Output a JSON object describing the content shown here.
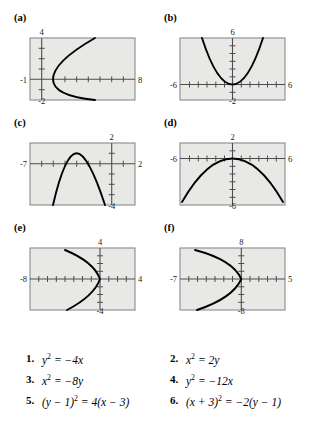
{
  "figure": {
    "type": "multi-panel-graph-matching-exercise",
    "panel_count": 6,
    "plot_bg_color": "#e8e8e6",
    "plot_border_color": "#8a8a8a",
    "curve_color": "#000000",
    "axis_color": "#555555"
  },
  "panels": [
    {
      "label": "(a)",
      "xmin": -1,
      "xmax": 8,
      "ymin": -2,
      "ymax": 4,
      "left_label": "-1",
      "right_label": "8",
      "top_label": "4",
      "bottom_label": "-2",
      "curve": {
        "form": "y^2 = 4(x - 1)",
        "opens": "right",
        "vertex_x": 1,
        "vertex_y": 0,
        "coef": 4
      }
    },
    {
      "label": "(b)",
      "xmin": -6,
      "xmax": 6,
      "ymin": -2,
      "ymax": 6,
      "left_label": "-6",
      "right_label": "6",
      "top_label": "6",
      "bottom_label": "-2",
      "curve": {
        "form": "x^2 = 2y",
        "opens": "up",
        "vertex_x": 0,
        "vertex_y": 0,
        "coef": 0.5
      }
    },
    {
      "label": "(c)",
      "xmin": -7,
      "xmax": 2,
      "ymin": -4,
      "ymax": 2,
      "left_label": "-7",
      "right_label": "2",
      "top_label": "2",
      "bottom_label": "-4",
      "curve": {
        "form": "(x + 3)^2 = -2(y - 1)",
        "opens": "down",
        "vertex_x": -3,
        "vertex_y": 1,
        "coef": -0.5
      }
    },
    {
      "label": "(d)",
      "xmin": -6,
      "xmax": 6,
      "ymin": -6,
      "ymax": 2,
      "left_label": "-6",
      "right_label": "6",
      "top_label": "2",
      "bottom_label": "-6",
      "curve": {
        "form": "x^2 = -8y",
        "opens": "down",
        "vertex_x": 0,
        "vertex_y": 0,
        "coef": -0.125
      }
    },
    {
      "label": "(e)",
      "xmin": -8,
      "xmax": 4,
      "ymin": -4,
      "ymax": 4,
      "left_label": "-8",
      "right_label": "4",
      "top_label": "4",
      "bottom_label": "-4",
      "curve": {
        "form": "y^2 = -4x",
        "opens": "left",
        "vertex_x": 0,
        "vertex_y": 0,
        "coef": -4
      }
    },
    {
      "label": "(f)",
      "xmin": -7,
      "xmax": 5,
      "ymin": -8,
      "ymax": 8,
      "left_label": "-7",
      "right_label": "5",
      "top_label": "8",
      "bottom_label": "-8",
      "curve": {
        "form": "y^2 = -12x",
        "opens": "left",
        "vertex_x": 0,
        "vertex_y": 0,
        "coef": -12
      }
    }
  ],
  "equations": [
    {
      "number": "1.",
      "lhs_base": "y",
      "lhs_exp": "2",
      "rhs": " = −4x",
      "plain": "y2 = -4x"
    },
    {
      "number": "2.",
      "lhs_base": "x",
      "lhs_exp": "2",
      "rhs": " = 2y",
      "plain": "x2 = 2y"
    },
    {
      "number": "3.",
      "lhs_base": "x",
      "lhs_exp": "2",
      "rhs": " = −8y",
      "plain": "x2 = -8y"
    },
    {
      "number": "4.",
      "lhs_base": "y",
      "lhs_exp": "2",
      "rhs": " = −12x",
      "plain": "y2 = -12x"
    },
    {
      "number": "5.",
      "lhs_base": "(y − 1)",
      "lhs_exp": "2",
      "rhs": " = 4(x − 3)",
      "plain": "(y - 1)2 = 4(x - 3)"
    },
    {
      "number": "6.",
      "lhs_base": "(x + 3)",
      "lhs_exp": "2",
      "rhs": " = −2(y − 1)",
      "plain": "(x + 3)2 = -2(y - 1)"
    }
  ]
}
